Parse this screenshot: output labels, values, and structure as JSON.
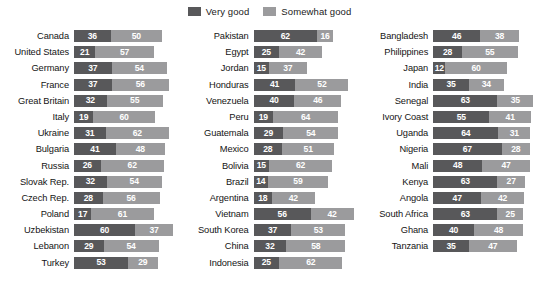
{
  "legend": {
    "items": [
      {
        "label": "Very good",
        "color": "#58585a",
        "key": "very_good"
      },
      {
        "label": "Somewhat good",
        "color": "#9b9b9d",
        "key": "somewhat_good"
      }
    ]
  },
  "chart_data": {
    "type": "bar",
    "orientation": "horizontal",
    "stacked": true,
    "title": "",
    "xlabel": "",
    "ylabel": "",
    "xlim": [
      0,
      100
    ],
    "grid": false,
    "legend_position": "top-center",
    "series": [
      {
        "name": "Very good",
        "color": "#58585a"
      },
      {
        "name": "Somewhat good",
        "color": "#9b9b9d"
      }
    ],
    "columns": [
      {
        "categories": [
          "Canada",
          "United States",
          "Germany",
          "France",
          "Great Britain",
          "Italy",
          "Ukraine",
          "Bulgaria",
          "Russia",
          "Slovak Rep.",
          "Czech Rep.",
          "Poland",
          "Uzbekistan",
          "Lebanon",
          "Turkey"
        ],
        "very_good": [
          36,
          21,
          37,
          37,
          32,
          19,
          31,
          41,
          26,
          32,
          28,
          17,
          60,
          29,
          53
        ],
        "somewhat_good": [
          50,
          57,
          54,
          56,
          55,
          60,
          62,
          48,
          62,
          54,
          56,
          61,
          37,
          54,
          29
        ]
      },
      {
        "categories": [
          "Pakistan",
          "Egypt",
          "Jordan",
          "Honduras",
          "Venezuela",
          "Peru",
          "Guatemala",
          "Mexico",
          "Bolivia",
          "Brazil",
          "Argentina",
          "Vietnam",
          "South Korea",
          "China",
          "Indonesia"
        ],
        "very_good": [
          62,
          25,
          15,
          41,
          40,
          19,
          29,
          28,
          15,
          14,
          18,
          56,
          37,
          32,
          25
        ],
        "somewhat_good": [
          16,
          42,
          37,
          52,
          46,
          64,
          54,
          51,
          62,
          59,
          42,
          42,
          53,
          58,
          62
        ]
      },
      {
        "categories": [
          "Bangladesh",
          "Philippines",
          "Japan",
          "India",
          "Senegal",
          "Ivory Coast",
          "Uganda",
          "Nigeria",
          "Mali",
          "Kenya",
          "Angola",
          "South Africa",
          "Ghana",
          "Tanzania"
        ],
        "very_good": [
          46,
          28,
          12,
          35,
          63,
          55,
          64,
          67,
          48,
          63,
          47,
          63,
          40,
          35
        ],
        "somewhat_good": [
          38,
          55,
          60,
          34,
          35,
          41,
          31,
          28,
          47,
          27,
          42,
          25,
          48,
          47
        ]
      }
    ]
  }
}
